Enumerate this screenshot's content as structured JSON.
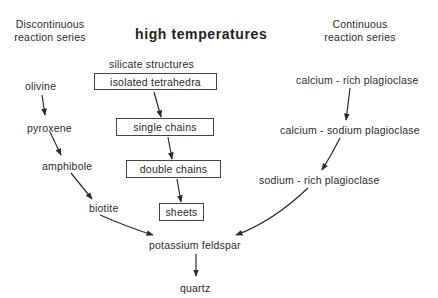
{
  "title": "high temperatures",
  "left_header": {
    "line1": "Discontinuous",
    "line2": "reaction series"
  },
  "right_header": {
    "line1": "Continuous",
    "line2": "reaction series"
  },
  "center_header": "silicate structures",
  "discontinuous_series": [
    "olivine",
    "pyroxene",
    "amphibole",
    "biotite"
  ],
  "silicate_structures": [
    "isolated tetrahedra",
    "single chains",
    "double chains",
    "sheets"
  ],
  "continuous_series": [
    "calcium - rich  plagioclase",
    "calcium - sodium  plagioclase",
    "sodium - rich  plagioclase"
  ],
  "convergence": [
    "potassium  feldspar",
    "quartz"
  ],
  "colors": {
    "line": "#2a2a2a",
    "background": "#ffffff"
  }
}
